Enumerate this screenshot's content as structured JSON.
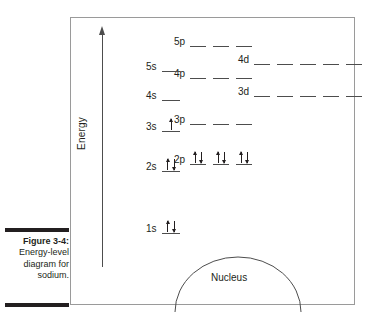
{
  "caption": {
    "figure_label": "Figure 3-4:",
    "lines": [
      "Energy-level",
      "diagram for",
      "sodium."
    ]
  },
  "figure": {
    "axis": {
      "label": "Energy",
      "direction": "up"
    },
    "nucleus": {
      "label": "Nucleus"
    }
  },
  "chart_data": {
    "type": "diagram",
    "title": "Energy-level diagram for sodium",
    "ylabel": "Energy",
    "grid": false,
    "legend": null,
    "annotations": [
      "Nucleus"
    ],
    "levels": [
      {
        "label": "1s",
        "column": "s",
        "x": 158,
        "y": 232,
        "sublevels": 1,
        "electrons": [
          "up",
          "down"
        ],
        "dash_width": 18
      },
      {
        "label": "2s",
        "column": "s",
        "x": 158,
        "y": 170,
        "sublevels": 1,
        "electrons": [
          "up",
          "down"
        ],
        "dash_width": 18
      },
      {
        "label": "2p",
        "column": "p",
        "x": 186,
        "y": 163,
        "sublevels": 3,
        "electrons": [
          "up",
          "down",
          "up",
          "down",
          "up",
          "down"
        ],
        "dash_width": 16
      },
      {
        "label": "3s",
        "column": "s",
        "x": 158,
        "y": 130,
        "sublevels": 1,
        "electrons": [
          "up"
        ],
        "dash_width": 18
      },
      {
        "label": "3p",
        "column": "p",
        "x": 186,
        "y": 123,
        "sublevels": 3,
        "electrons": [],
        "dash_width": 16
      },
      {
        "label": "3d",
        "column": "d",
        "x": 250,
        "y": 95,
        "sublevels": 5,
        "electrons": [],
        "dash_width": 16
      },
      {
        "label": "4s",
        "column": "s",
        "x": 158,
        "y": 99,
        "sublevels": 1,
        "electrons": [],
        "dash_width": 18
      },
      {
        "label": "4p",
        "column": "p",
        "x": 186,
        "y": 77,
        "sublevels": 3,
        "electrons": [],
        "dash_width": 16
      },
      {
        "label": "4d",
        "column": "d",
        "x": 250,
        "y": 63,
        "sublevels": 5,
        "electrons": [],
        "dash_width": 16
      },
      {
        "label": "5s",
        "column": "s",
        "x": 158,
        "y": 70,
        "sublevels": 1,
        "electrons": [],
        "dash_width": 18
      },
      {
        "label": "5p",
        "column": "p",
        "x": 186,
        "y": 45,
        "sublevels": 3,
        "electrons": [],
        "dash_width": 16
      }
    ]
  }
}
